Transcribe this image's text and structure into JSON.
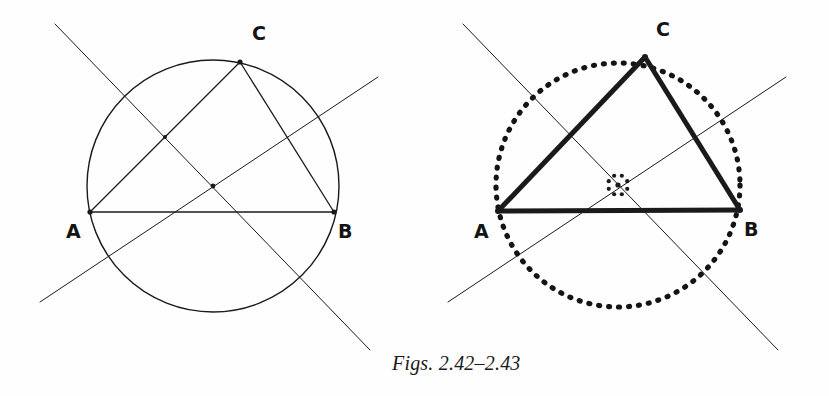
{
  "page": {
    "width": 829,
    "height": 396,
    "background_color": "#fefefe",
    "ink_color": "#1a1a1a"
  },
  "caption": {
    "text": "Figs. 2.42–2.43",
    "x": 392,
    "y": 352,
    "style": "italic-serif"
  },
  "figures": [
    {
      "id": "fig-2-42",
      "name": "left-figure",
      "description": "Circle through A, B, C with chords AC, CB and two perpendicular bisector lines meeting at the circumcenter",
      "circle": {
        "cx": 213,
        "cy": 186,
        "r": 126,
        "stroke": "#1a1a1a",
        "stroke_width": 1.4,
        "dashed": false
      },
      "vertices": [
        {
          "key": "A",
          "label": "A",
          "x": 90,
          "y": 212,
          "label_x": 66,
          "label_y": 222
        },
        {
          "key": "B",
          "label": "B",
          "x": 334,
          "y": 212,
          "label_x": 338,
          "label_y": 222
        },
        {
          "key": "C",
          "label": "C",
          "x": 240,
          "y": 62,
          "label_x": 252,
          "label_y": 24
        }
      ],
      "segments": [
        {
          "name": "side-ab",
          "from": [
            90,
            212
          ],
          "to": [
            334,
            212
          ],
          "stroke_width": 1.6
        },
        {
          "name": "side-ac",
          "from": [
            90,
            212
          ],
          "to": [
            240,
            62
          ],
          "stroke_width": 1.3
        },
        {
          "name": "side-cb",
          "from": [
            240,
            62
          ],
          "to": [
            334,
            212
          ],
          "stroke_width": 1.3
        }
      ],
      "construction_lines": [
        {
          "name": "bisector-of-ac",
          "from": [
            55,
            24
          ],
          "to": [
            370,
            350
          ],
          "stroke_width": 1.0
        },
        {
          "name": "bisector-of-ab",
          "from": [
            40,
            302
          ],
          "to": [
            378,
            77
          ],
          "stroke_width": 1.0
        }
      ],
      "marked_points": [
        {
          "name": "circumcenter-dot",
          "x": 213,
          "y": 186,
          "r": 2.4
        },
        {
          "name": "midpoint-ac-dot",
          "x": 165,
          "y": 137,
          "r": 2.0
        }
      ],
      "center_marker": null
    },
    {
      "id": "fig-2-43",
      "name": "right-figure",
      "description": "Bold triangle ABC inscribed in a dotted circumcircle, with perpendicular bisectors meeting at a ringed circumcenter",
      "circle": {
        "cx": 618,
        "cy": 185,
        "r": 122,
        "stroke": "#141414",
        "stroke_width": 5.2,
        "dashed": true,
        "dash_pattern": "1 9"
      },
      "vertices": [
        {
          "key": "A",
          "label": "A",
          "x": 498,
          "y": 211,
          "label_x": 474,
          "label_y": 222
        },
        {
          "key": "B",
          "label": "B",
          "x": 740,
          "y": 210,
          "label_x": 744,
          "label_y": 220
        },
        {
          "key": "C",
          "label": "C",
          "x": 645,
          "y": 57,
          "label_x": 656,
          "label_y": 20
        }
      ],
      "segments": [
        {
          "name": "side-ab",
          "from": [
            498,
            211
          ],
          "to": [
            740,
            210
          ],
          "stroke_width": 5.0
        },
        {
          "name": "side-ac",
          "from": [
            498,
            211
          ],
          "to": [
            645,
            57
          ],
          "stroke_width": 5.0
        },
        {
          "name": "side-cb",
          "from": [
            645,
            57
          ],
          "to": [
            740,
            210
          ],
          "stroke_width": 5.0
        }
      ],
      "construction_lines": [
        {
          "name": "bisector-of-ac",
          "from": [
            463,
            24
          ],
          "to": [
            778,
            350
          ],
          "stroke_width": 1.0
        },
        {
          "name": "bisector-of-ab",
          "from": [
            448,
            302
          ],
          "to": [
            786,
            77
          ],
          "stroke_width": 1.0
        }
      ],
      "marked_points": [
        {
          "name": "circumcenter-dot",
          "x": 618,
          "y": 185,
          "r": 2.6
        }
      ],
      "center_marker": {
        "name": "circumcenter-ring",
        "cx": 618,
        "cy": 185,
        "r": 10,
        "dot_count": 8,
        "dot_r": 2.1
      }
    }
  ]
}
